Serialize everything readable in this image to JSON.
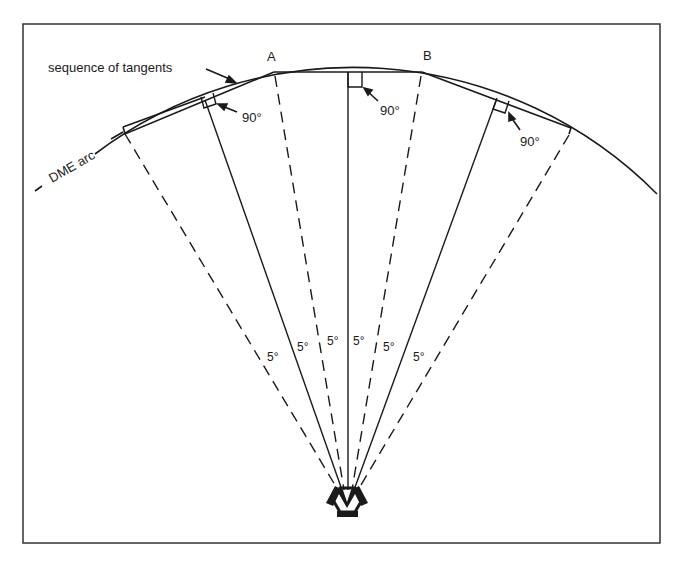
{
  "diagram": {
    "labels": {
      "tangents": "sequence of tangents",
      "arc": "DME arc",
      "point_a": "A",
      "point_b": "B",
      "right_angle_1": "90°",
      "right_angle_2": "90°",
      "right_angle_3": "90°"
    },
    "angle_labels": [
      "5°",
      "5°",
      "5°",
      "5°",
      "5°",
      "5°"
    ],
    "station": "VOR/DME",
    "colors": {
      "line": "#1a1a1a",
      "background": "#ffffff"
    }
  }
}
